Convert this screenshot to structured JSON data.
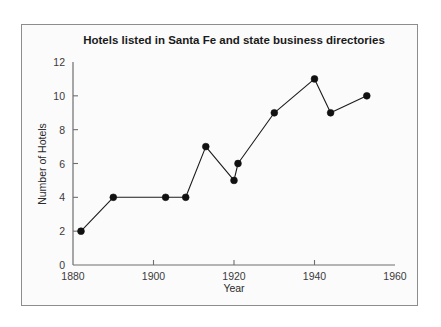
{
  "chart_data": {
    "type": "line",
    "title": "Hotels listed in Santa Fe and state business directories",
    "xlabel": "Year",
    "ylabel": "Number of Hotels",
    "xlim": [
      1880,
      1960
    ],
    "ylim": [
      0,
      12
    ],
    "grid": false,
    "legend": "none",
    "marker": "filled-circle",
    "line_color": "#1c1c1c",
    "marker_color": "#111111",
    "xticks": [
      1880,
      1900,
      1920,
      1940,
      1960
    ],
    "xtick_labels": [
      "1880",
      "1900",
      "1920",
      "1940",
      "1960"
    ],
    "yticks": [
      0,
      2,
      4,
      6,
      8,
      10,
      12
    ],
    "ytick_labels": [
      "0",
      "2",
      "4",
      "6",
      "8",
      "10",
      "12"
    ],
    "x": [
      1882,
      1890,
      1903,
      1908,
      1913,
      1920,
      1921,
      1930,
      1940,
      1944,
      1953
    ],
    "values": [
      2,
      4,
      4,
      4,
      7,
      5,
      6,
      9,
      11,
      9,
      10
    ],
    "points": [
      {
        "x": 1882,
        "y": 2
      },
      {
        "x": 1890,
        "y": 4
      },
      {
        "x": 1903,
        "y": 4
      },
      {
        "x": 1908,
        "y": 4
      },
      {
        "x": 1913,
        "y": 7
      },
      {
        "x": 1920,
        "y": 5
      },
      {
        "x": 1921,
        "y": 6
      },
      {
        "x": 1930,
        "y": 9
      },
      {
        "x": 1940,
        "y": 11
      },
      {
        "x": 1944,
        "y": 9
      },
      {
        "x": 1953,
        "y": 10
      }
    ]
  },
  "figure": {
    "background_color": "#fbfbfb",
    "frame_color": "#8d8d8d"
  }
}
